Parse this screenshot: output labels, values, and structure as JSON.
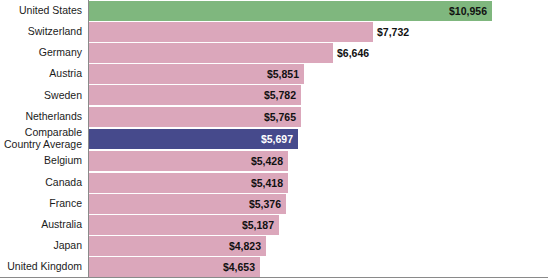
{
  "chart_data": {
    "type": "bar",
    "orientation": "horizontal",
    "title": "",
    "xlabel": "",
    "ylabel": "",
    "grid": false,
    "legend": null,
    "xlim": [
      0,
      10956
    ],
    "categories": [
      "United States",
      "Switzerland",
      "Germany",
      "Austria",
      "Sweden",
      "Netherlands",
      "Comparable\nCountry Average",
      "Belgium",
      "Canada",
      "France",
      "Australia",
      "Japan",
      "United Kingdom"
    ],
    "values": [
      10956,
      7732,
      6646,
      5851,
      5782,
      5765,
      5697,
      5428,
      5418,
      5376,
      5187,
      4823,
      4653
    ],
    "labels": [
      "$10,956",
      "$7,732",
      "$6,646",
      "$5,851",
      "$5,782",
      "$5,765",
      "$5,697",
      "$5,428",
      "$5,418",
      "$5,376",
      "$5,187",
      "$4,823",
      "$4,653"
    ],
    "label_position": [
      "inside",
      "outside",
      "outside",
      "inside",
      "inside",
      "inside",
      "inside",
      "inside",
      "inside",
      "inside",
      "inside",
      "inside",
      "inside"
    ],
    "colors": {
      "default_bar": "#dba7bb",
      "top_bar": "#7fb77e",
      "average_bar": "#464a8c",
      "label_text": "#111111",
      "average_label_text": "#ffffff",
      "axis_line": "#8a8a8a"
    },
    "highlight": {
      "top_bar_index": 0,
      "average_bar_index": 6
    }
  }
}
